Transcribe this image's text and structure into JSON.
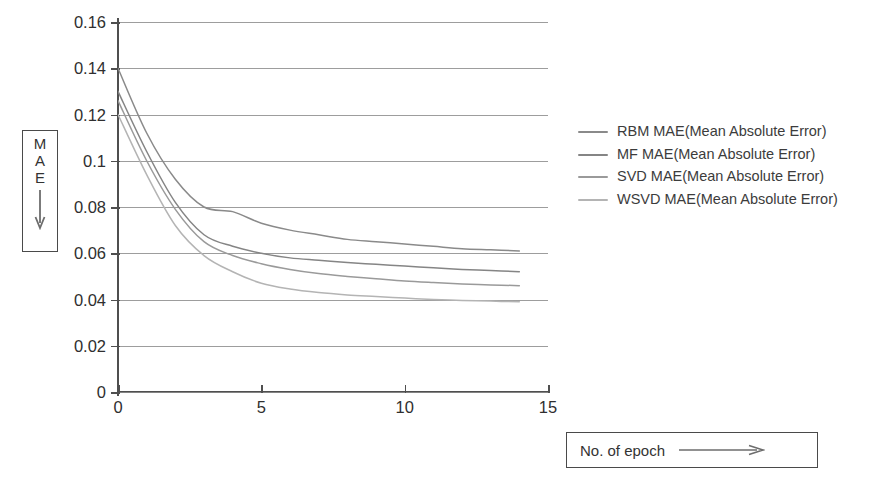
{
  "axis_label_box": {
    "letters": [
      "M",
      "A",
      "E"
    ],
    "arrow_icon": "down-arrow-icon"
  },
  "xaxis_label_box": {
    "text": "No. of epoch",
    "arrow_icon": "right-arrow-icon"
  },
  "legend": {
    "position": "right",
    "entries": [
      {
        "label": "RBM MAE(Mean Absolute Error)",
        "color": "#8a8a8a"
      },
      {
        "label": "MF MAE(Mean Absolute Error)",
        "color": "#858585"
      },
      {
        "label": "SVD MAE(Mean Absolute Error)",
        "color": "#9a9a9a"
      },
      {
        "label": "WSVD MAE(Mean Absolute Error)",
        "color": "#b4b4b4"
      }
    ]
  },
  "chart_data": {
    "type": "line",
    "title": "",
    "xlabel": "No. of epoch",
    "ylabel": "MAE",
    "xlim": [
      0,
      15
    ],
    "ylim": [
      0,
      0.16
    ],
    "grid": true,
    "xticks": [
      0,
      5,
      10,
      15
    ],
    "xticklabels": [
      "0",
      "5",
      "10",
      "15"
    ],
    "yticks": [
      0,
      0.02,
      0.04,
      0.06,
      0.08,
      0.1,
      0.12,
      0.14,
      0.16
    ],
    "yticklabels": [
      "0",
      "0.02",
      "0.04",
      "0.06",
      "0.08",
      "0.1",
      "0.12",
      "0.14",
      "0.16"
    ],
    "x": [
      0,
      1,
      2,
      3,
      4,
      5,
      6,
      7,
      8,
      9,
      10,
      11,
      12,
      13,
      14
    ],
    "series": [
      {
        "name": "RBM MAE(Mean Absolute Error)",
        "color": "#8a8a8a",
        "values": [
          0.14,
          0.112,
          0.092,
          0.08,
          0.078,
          0.073,
          0.07,
          0.068,
          0.066,
          0.065,
          0.064,
          0.063,
          0.062,
          0.0615,
          0.061
        ]
      },
      {
        "name": "MF MAE(Mean Absolute Error)",
        "color": "#858585",
        "values": [
          0.13,
          0.104,
          0.082,
          0.068,
          0.063,
          0.06,
          0.058,
          0.057,
          0.056,
          0.0552,
          0.0545,
          0.0537,
          0.053,
          0.0525,
          0.052
        ]
      },
      {
        "name": "SVD MAE(Mean Absolute Error)",
        "color": "#9a9a9a",
        "values": [
          0.126,
          0.1,
          0.079,
          0.065,
          0.059,
          0.0555,
          0.053,
          0.0512,
          0.05,
          0.049,
          0.048,
          0.0473,
          0.0467,
          0.0463,
          0.046
        ]
      },
      {
        "name": "WSVD MAE(Mean Absolute Error)",
        "color": "#b4b4b4",
        "values": [
          0.12,
          0.094,
          0.072,
          0.059,
          0.052,
          0.047,
          0.0445,
          0.043,
          0.042,
          0.0413,
          0.0406,
          0.04,
          0.0396,
          0.0393,
          0.039
        ]
      }
    ]
  }
}
